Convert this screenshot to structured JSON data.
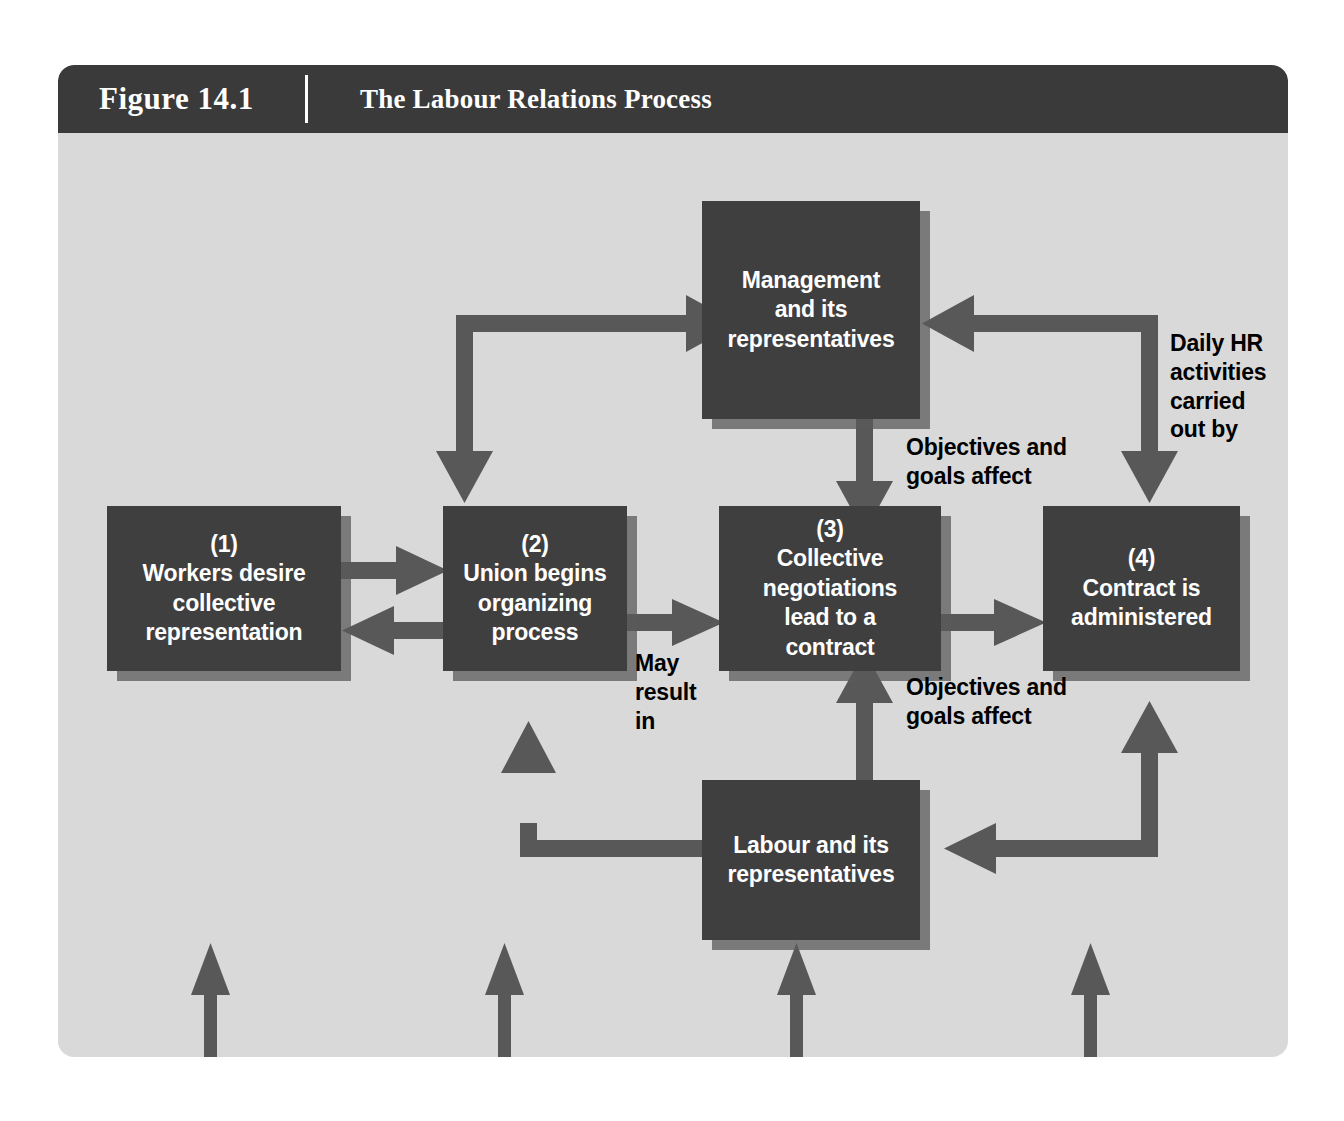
{
  "figure": {
    "label": "Figure 14.1",
    "title": "The Labour Relations Process",
    "caption": "LAWS AND REGULATIONS"
  },
  "colors": {
    "panel_background": "#d9d9d9",
    "header_background": "#3a3a3a",
    "node_fill": "#3f3f3f",
    "node_shadow": "#5a5a5a",
    "arrow": "#585858",
    "node_text": "#ffffff",
    "label_text": "#000000"
  },
  "nodes": [
    {
      "id": "management",
      "text": "Management\nand its\nrepresentatives"
    },
    {
      "id": "workers",
      "number": "(1)",
      "text": "(1)\nWorkers desire\ncollective\nrepresentation"
    },
    {
      "id": "union",
      "number": "(2)",
      "text": "(2)\nUnion begins\norganizing\nprocess"
    },
    {
      "id": "negotiations",
      "number": "(3)",
      "text": "(3)\nCollective\nnegotiations\nlead to a\ncontract"
    },
    {
      "id": "contract",
      "number": "(4)",
      "text": "(4)\nContract is\nadministered"
    },
    {
      "id": "labour",
      "text": "Labour and its\nrepresentatives"
    }
  ],
  "edge_labels": [
    {
      "id": "objectives-top",
      "text": "Objectives and\ngoals affect"
    },
    {
      "id": "daily-hr",
      "text": "Daily HR\nactivities\ncarried\nout by"
    },
    {
      "id": "may-result",
      "text": "May\nresult\nin"
    },
    {
      "id": "objectives-bottom",
      "text": "Objectives and\ngoals affect"
    }
  ]
}
